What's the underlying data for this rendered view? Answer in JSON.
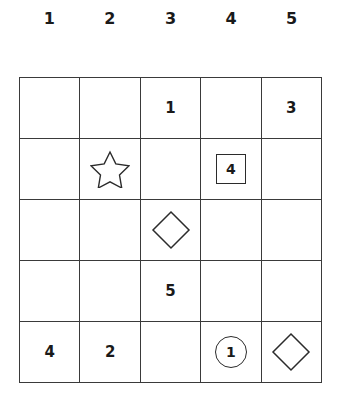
{
  "grid": {
    "columns": 5,
    "rows": 5,
    "line_color": "#3a3a3a",
    "background_color": "#ffffff",
    "text_color": "#1a1a1a",
    "column_headers": [
      "1",
      "2",
      "3",
      "4",
      "5"
    ],
    "cells": [
      [
        {
          "type": "empty",
          "value": ""
        },
        {
          "type": "empty",
          "value": ""
        },
        {
          "type": "number",
          "value": "1"
        },
        {
          "type": "empty",
          "value": ""
        },
        {
          "type": "number",
          "value": "3"
        }
      ],
      [
        {
          "type": "empty",
          "value": ""
        },
        {
          "type": "star",
          "value": ""
        },
        {
          "type": "empty",
          "value": ""
        },
        {
          "type": "boxed-number",
          "value": "4"
        },
        {
          "type": "empty",
          "value": ""
        }
      ],
      [
        {
          "type": "empty",
          "value": ""
        },
        {
          "type": "empty",
          "value": ""
        },
        {
          "type": "diamond",
          "value": ""
        },
        {
          "type": "empty",
          "value": ""
        },
        {
          "type": "empty",
          "value": ""
        }
      ],
      [
        {
          "type": "empty",
          "value": ""
        },
        {
          "type": "empty",
          "value": ""
        },
        {
          "type": "number",
          "value": "5"
        },
        {
          "type": "empty",
          "value": ""
        },
        {
          "type": "empty",
          "value": ""
        }
      ],
      [
        {
          "type": "number",
          "value": "4"
        },
        {
          "type": "number",
          "value": "2"
        },
        {
          "type": "empty",
          "value": ""
        },
        {
          "type": "circled-number",
          "value": "1"
        },
        {
          "type": "diamond",
          "value": ""
        }
      ]
    ]
  }
}
